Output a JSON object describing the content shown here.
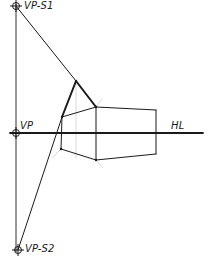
{
  "diagram": {
    "colors": {
      "ink": "#1a1a1a",
      "guide": "#cfcfcf",
      "paper": "#ffffff"
    },
    "labels": {
      "vp_s1": "VP-S1",
      "vp": "VP",
      "vp_s2": "VP-S2",
      "horizon": "HL"
    },
    "points": {
      "vp_s1": [
        16,
        6
      ],
      "vp": [
        16,
        133
      ],
      "vp_s2": [
        18,
        250
      ],
      "roof_apex": [
        76,
        81
      ],
      "front_left_top": [
        62,
        117
      ],
      "front_left_bottom": [
        61,
        149
      ],
      "front_corner_top": [
        96,
        107
      ],
      "front_corner_bottom": [
        96,
        160
      ],
      "right_top": [
        156,
        110
      ],
      "right_bottom": [
        156,
        154
      ]
    },
    "lines": [
      {
        "name": "vertical-measuring-line",
        "from": [
          16,
          4
        ],
        "to": [
          16,
          252
        ]
      },
      {
        "name": "horizon-line",
        "from": [
          10,
          133
        ],
        "to": [
          203,
          133
        ]
      },
      {
        "name": "vp-s1-to-apex",
        "from": [
          16,
          6
        ],
        "to": [
          76,
          81
        ]
      },
      {
        "name": "vp-s2-to-gable",
        "from": [
          18,
          250
        ],
        "to": [
          62,
          117
        ]
      },
      {
        "name": "gable-left-edge",
        "from": [
          62,
          117
        ],
        "to": [
          76,
          81
        ]
      },
      {
        "name": "gable-right-edge",
        "from": [
          76,
          81
        ],
        "to": [
          96,
          107
        ]
      },
      {
        "name": "front-left-top",
        "from": [
          62,
          117
        ],
        "to": [
          96,
          107
        ]
      },
      {
        "name": "front-left-bottom",
        "from": [
          61,
          149
        ],
        "to": [
          96,
          160
        ]
      },
      {
        "name": "front-left-vertical",
        "from": [
          62,
          117
        ],
        "to": [
          61,
          149
        ]
      },
      {
        "name": "front-corner-vertical",
        "from": [
          96,
          107
        ],
        "to": [
          96,
          160
        ]
      },
      {
        "name": "right-top",
        "from": [
          96,
          107
        ],
        "to": [
          156,
          110
        ]
      },
      {
        "name": "right-bottom",
        "from": [
          96,
          160
        ],
        "to": [
          156,
          154
        ]
      },
      {
        "name": "right-vertical",
        "from": [
          156,
          110
        ],
        "to": [
          156,
          154
        ]
      }
    ],
    "guides": [
      {
        "name": "apex-vertical-guide",
        "from": [
          76,
          81
        ],
        "to": [
          76,
          158
        ]
      },
      {
        "name": "corner-guide-up",
        "from": [
          96,
          107
        ],
        "to": [
          102,
          99
        ]
      },
      {
        "name": "corner-guide-down",
        "from": [
          96,
          160
        ],
        "to": [
          103,
          168
        ]
      },
      {
        "name": "left-guide-down",
        "from": [
          61,
          149
        ],
        "to": [
          52,
          158
        ]
      }
    ]
  }
}
